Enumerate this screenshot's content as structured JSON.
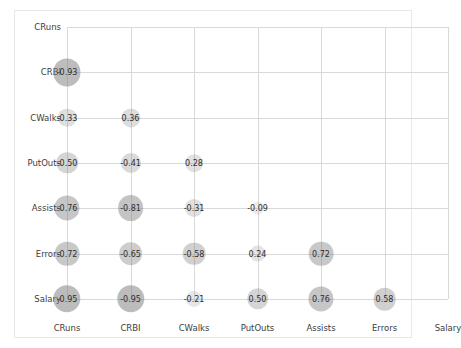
{
  "chart_data": {
    "type": "heatmap",
    "title": "",
    "subtitle": "",
    "xlabel": "",
    "ylabel": "",
    "grid": true,
    "legend": "none",
    "style": "correlogram-bubble-matrix",
    "note": "Lower-triangular correlation matrix; bubble area scales with absolute correlation, bubble darkness scales with absolute correlation.",
    "categories": [
      "CRuns",
      "CRBI",
      "CWalks",
      "PutOuts",
      "Assists",
      "Errors",
      "Salary"
    ],
    "x_tick_labels": [
      "CRuns",
      "CRBI",
      "CWalks",
      "PutOuts",
      "Assists",
      "Errors",
      "Salary"
    ],
    "y_tick_labels": [
      "CRuns",
      "CRBI",
      "CWalks",
      "PutOuts",
      "Assists",
      "Errors",
      "Salary"
    ],
    "cells": [
      {
        "row": "CRBI",
        "col": "CRuns",
        "value": -0.93,
        "label": "-0.93"
      },
      {
        "row": "CWalks",
        "col": "CRuns",
        "value": -0.33,
        "label": "-0.33"
      },
      {
        "row": "CWalks",
        "col": "CRBI",
        "value": 0.36,
        "label": "0.36"
      },
      {
        "row": "PutOuts",
        "col": "CRuns",
        "value": -0.5,
        "label": "-0.50"
      },
      {
        "row": "PutOuts",
        "col": "CRBI",
        "value": -0.41,
        "label": "-0.41"
      },
      {
        "row": "PutOuts",
        "col": "CWalks",
        "value": 0.28,
        "label": "0.28"
      },
      {
        "row": "Assists",
        "col": "CRuns",
        "value": -0.76,
        "label": "-0.76"
      },
      {
        "row": "Assists",
        "col": "CRBI",
        "value": -0.81,
        "label": "-0.81"
      },
      {
        "row": "Assists",
        "col": "CWalks",
        "value": -0.31,
        "label": "-0.31"
      },
      {
        "row": "Assists",
        "col": "PutOuts",
        "value": -0.09,
        "label": "-0.09"
      },
      {
        "row": "Errors",
        "col": "CRuns",
        "value": -0.72,
        "label": "-0.72"
      },
      {
        "row": "Errors",
        "col": "CRBI",
        "value": -0.65,
        "label": "-0.65"
      },
      {
        "row": "Errors",
        "col": "CWalks",
        "value": -0.58,
        "label": "-0.58"
      },
      {
        "row": "Errors",
        "col": "PutOuts",
        "value": 0.24,
        "label": "0.24"
      },
      {
        "row": "Errors",
        "col": "Assists",
        "value": 0.72,
        "label": "0.72"
      },
      {
        "row": "Salary",
        "col": "CRuns",
        "value": -0.95,
        "label": "-0.95"
      },
      {
        "row": "Salary",
        "col": "CRBI",
        "value": -0.95,
        "label": "-0.95"
      },
      {
        "row": "Salary",
        "col": "CWalks",
        "value": -0.21,
        "label": "-0.21"
      },
      {
        "row": "Salary",
        "col": "PutOuts",
        "value": 0.5,
        "label": "0.50"
      },
      {
        "row": "Salary",
        "col": "Assists",
        "value": 0.76,
        "label": "0.76"
      },
      {
        "row": "Salary",
        "col": "Errors",
        "value": 0.58,
        "label": "0.58"
      }
    ],
    "colors": {
      "bubble": "#b0b0b0",
      "gridline": "#d9d9d9",
      "frame": "#e8e8e8",
      "text": "#2e2e2e",
      "tick_text": "#3c3c3c",
      "background": "#ffffff"
    }
  },
  "layout": {
    "plot_left": 67,
    "plot_top": 27,
    "col_step": 63.5,
    "row_step": 45.3,
    "x_label_y": 323,
    "y_label_right": 61
  }
}
